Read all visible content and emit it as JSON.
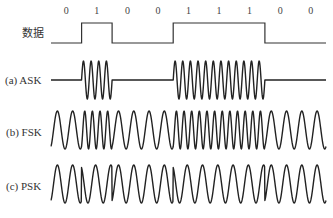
{
  "diagram": {
    "bits": [
      "0",
      "1",
      "0",
      "0",
      "1",
      "1",
      "1",
      "0",
      "0"
    ],
    "rows": [
      {
        "id": "data",
        "label": "数据"
      },
      {
        "id": "ask",
        "label": "(a) ASK"
      },
      {
        "id": "fsk",
        "label": "(b) FSK"
      },
      {
        "id": "psk",
        "label": "(c) PSK"
      }
    ],
    "params": {
      "ask_cycles_per_bit_1": 4,
      "ask_cycles_per_bit_0": 0,
      "fsk_cycles_per_bit_0": 2,
      "fsk_cycles_per_bit_1": 4,
      "psk_cycles_per_bit": 2,
      "psk_phase_flip_on_bit_change": true
    },
    "colors": {
      "line": "#222222",
      "background": "#ffffff"
    }
  }
}
